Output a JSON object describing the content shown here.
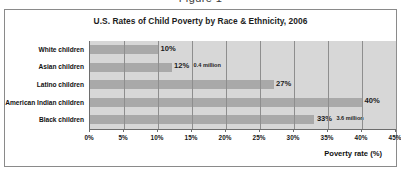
{
  "figure": {
    "caption": "Figure 1"
  },
  "chart_data": {
    "type": "bar",
    "orientation": "horizontal",
    "title": "U.S. Rates of Child Poverty by Race & Ethnicity, 2006",
    "xlabel": "Poverty rate (%)",
    "ylabel": "",
    "xlim": [
      0,
      45
    ],
    "xtick_labels": [
      "0%",
      "5%",
      "10%",
      "15%",
      "20%",
      "25%",
      "30%",
      "35%",
      "40%",
      "45%"
    ],
    "xtick_values": [
      0,
      5,
      10,
      15,
      20,
      25,
      30,
      35,
      40,
      45
    ],
    "grid": true,
    "legend": false,
    "categories": [
      "White children",
      "Asian children",
      "Latino children",
      "American Indian children",
      "Black children"
    ],
    "values": [
      10,
      12,
      27,
      40,
      33
    ],
    "data_labels": [
      "10%",
      "12%",
      "27%",
      "40%",
      "33%"
    ],
    "annotations": [
      {
        "category": "Asian children",
        "text": "0.4 million"
      },
      {
        "category": "Black children",
        "text": "3.6 million"
      }
    ],
    "colors": {
      "bar": "#a9a9a9",
      "plot_background": "#d7d7d7",
      "gridline": "#8e8e8e",
      "axis": "#6d6d6d",
      "frame": "#8a8a8a",
      "text": "#111111"
    }
  }
}
